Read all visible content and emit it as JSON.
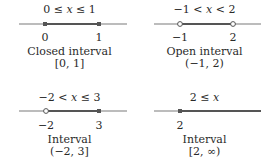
{
  "colors": {
    "axis": "#7a7a7a",
    "segment": "#555555",
    "dot_fill": "#555555",
    "open_fill": "#ffffff",
    "text": "#2a2a2a"
  },
  "panels": [
    {
      "inequality": "0 ≤ x ≤ 1",
      "ticks": [
        "0",
        "1"
      ],
      "label": "Closed interval",
      "notation": "[0, 1]",
      "left_endpoint": "closed",
      "right_endpoint": "closed"
    },
    {
      "inequality": "−1 < x < 2",
      "ticks": [
        "−1",
        "2"
      ],
      "label": "Open interval",
      "notation": "(−1, 2)",
      "left_endpoint": "open",
      "right_endpoint": "open"
    },
    {
      "inequality": "−2 < x ≤ 3",
      "ticks": [
        "−2",
        "3"
      ],
      "label": "Interval",
      "notation": "(−2, 3]",
      "left_endpoint": "open",
      "right_endpoint": "closed"
    },
    {
      "inequality": "2 ≤ x",
      "ticks": [
        "2"
      ],
      "label": "Interval",
      "notation": "[2, ∞)",
      "left_endpoint": "closed",
      "right_endpoint": "unbounded"
    }
  ]
}
